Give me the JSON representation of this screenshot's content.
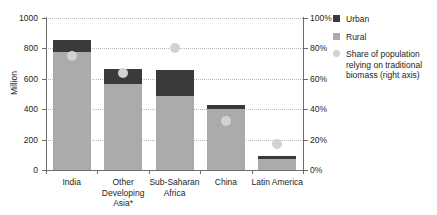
{
  "chart_data": {
    "type": "bar",
    "title": "",
    "subtitle": "",
    "xlabel": "",
    "ylabel": "Million",
    "ylabel_right": "",
    "ylim": [
      0,
      1000
    ],
    "ylim_right": [
      0,
      100
    ],
    "grid": true,
    "legend_position": "right",
    "categories": [
      "India",
      "Other Developing Asia*",
      "Sub-Saharan Africa",
      "China",
      "Latin America"
    ],
    "series": [
      {
        "name": "Rural",
        "axis": "left",
        "unit": "Million",
        "values": [
          775,
          565,
          490,
          400,
          75
        ]
      },
      {
        "name": "Urban",
        "axis": "left",
        "unit": "Million",
        "values": [
          80,
          100,
          165,
          25,
          15
        ]
      },
      {
        "name": "Share of population relying on traditional biomass (right axis)",
        "axis": "right",
        "unit": "%",
        "marker": "circle",
        "values": [
          75,
          64,
          80,
          32,
          17
        ]
      }
    ],
    "totals": [
      855,
      665,
      655,
      425,
      90
    ],
    "yticks": [
      0,
      200,
      400,
      600,
      800,
      1000
    ],
    "yticklabels": [
      "0",
      "200",
      "400",
      "600",
      "800",
      "1000"
    ],
    "yticks_right": [
      0,
      20,
      40,
      60,
      80,
      100
    ],
    "yticklabels_right": [
      "0%",
      "20%",
      "40%",
      "60%",
      "80%",
      "100%"
    ]
  },
  "legend": {
    "items": [
      {
        "label": "Urban",
        "marker": "square",
        "color": "#3a3a3a"
      },
      {
        "label": "Rural",
        "marker": "square",
        "color": "#ababab"
      },
      {
        "label": "Share of population relying on traditional biomass (right axis)",
        "marker": "circle",
        "color": "#d2d2d2"
      }
    ]
  },
  "colors": {
    "urban": "#3a3a3a",
    "rural": "#ababab",
    "dot": "#d2d2d2",
    "axis": "#6d6d6d",
    "grid": "#b9b9b9",
    "text": "#231f20",
    "background": "#ffffff"
  }
}
